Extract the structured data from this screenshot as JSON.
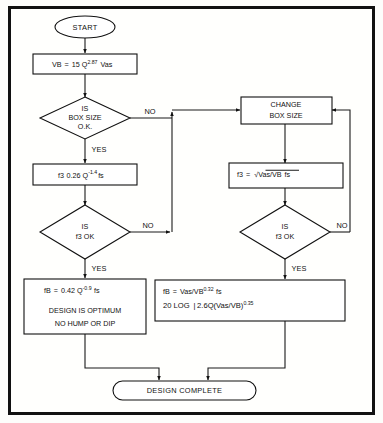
{
  "diagram": {
    "frame": {
      "border_color": "#111111",
      "background": "#ffffff"
    },
    "nodes": {
      "start": {
        "label": "START",
        "type": "terminator"
      },
      "vb_formula": {
        "type": "process",
        "text": "VB = 15 Q2.87 Vas",
        "parts": {
          "lhs": "VB",
          "eq": "=",
          "coef": "15 Q",
          "exp": "2.87",
          "tail": "Vas"
        }
      },
      "box_size_decision": {
        "type": "decision",
        "line1": "IS",
        "line2": "BOX SIZE",
        "line3": "O.K."
      },
      "f3_formula_left": {
        "type": "process",
        "text": "f3 0.26 Q-1.4 fs",
        "parts": {
          "lhs": "f3",
          "coef": "0.26 Q",
          "exp": "-1.4",
          "tail": "fs"
        }
      },
      "f3_decision_left": {
        "type": "decision",
        "line1": "IS",
        "line2": "f3 OK"
      },
      "optimum_box": {
        "type": "process",
        "line1_parts": {
          "lhs": "fB",
          "eq": "=",
          "coef": "0.42  Q",
          "exp": "-0.9",
          "tail": "fs"
        },
        "line2": "DESIGN IS OPTIMUM",
        "line3": "NO HUMP OR DIP"
      },
      "change_box_size": {
        "type": "process",
        "line1": "CHANGE",
        "line2": "BOX SIZE"
      },
      "f3_formula_right": {
        "type": "process",
        "text": "f3 = √Vas/VB  fs",
        "parts": {
          "lhs": "f3",
          "eq": "=",
          "radical": "Vas/VB",
          "tail": "fs"
        }
      },
      "f3_decision_right": {
        "type": "decision",
        "line1": "IS",
        "line2": "f3 OK"
      },
      "result_box": {
        "type": "process",
        "line1_parts": {
          "lhs": "fB",
          "eq": "=",
          "frac": "Vas/VB",
          "exp": "0.32",
          "tail": "fs"
        },
        "line2_parts": {
          "pre": "20 LOG",
          "bracket": "|",
          "body": "2.6Q(Vas/VB)",
          "exp": "0.35"
        }
      },
      "design_complete": {
        "label": "DESIGN COMPLETE",
        "type": "terminator"
      }
    },
    "edge_labels": {
      "box_size_no": "NO",
      "box_size_yes": "YES",
      "f3_left_no": "NO",
      "f3_left_yes": "YES",
      "f3_right_no": "NO",
      "f3_right_yes": "YES"
    }
  }
}
